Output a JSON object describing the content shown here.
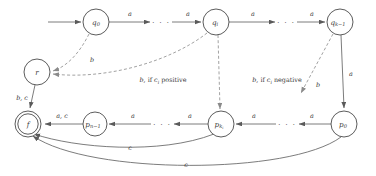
{
  "diagram": {
    "type": "state-machine",
    "colors": {
      "background": "#ffffff",
      "node_stroke": "#4a4a4a",
      "edge_solid": "#5a5a5a",
      "edge_dashed": "#8a8a8a",
      "text": "#3a3a3a"
    },
    "nodes": [
      {
        "id": "q0",
        "label_base": "q",
        "label_sub": "0",
        "x": 96,
        "y": 22,
        "r": 13,
        "accepting": false,
        "initial": true
      },
      {
        "id": "qi",
        "label_base": "q",
        "label_sub": "i",
        "x": 216,
        "y": 22,
        "r": 13,
        "accepting": false,
        "initial": false
      },
      {
        "id": "qk1",
        "label_base": "q",
        "label_sub": "k−1",
        "x": 340,
        "y": 22,
        "r": 13,
        "accepting": false,
        "initial": false
      },
      {
        "id": "r",
        "label_base": "r",
        "label_sub": "",
        "x": 37,
        "y": 72,
        "r": 13,
        "accepting": false,
        "initial": false
      },
      {
        "id": "f",
        "label_base": "f",
        "label_sub": "",
        "x": 28,
        "y": 124,
        "r": 13,
        "accepting": true,
        "initial": false
      },
      {
        "id": "pn1",
        "label_base": "p",
        "label_sub": "n−1",
        "x": 95,
        "y": 124,
        "r": 12,
        "accepting": false,
        "initial": false
      },
      {
        "id": "pki",
        "label_base": "p",
        "label_sub": "k",
        "label_sub2": "i",
        "x": 221,
        "y": 124,
        "r": 13,
        "accepting": false,
        "initial": false
      },
      {
        "id": "p0",
        "label_base": "p",
        "label_sub": "0",
        "x": 344,
        "y": 124,
        "r": 13,
        "accepting": false,
        "initial": false
      }
    ],
    "edge_labels": {
      "a": "a",
      "b": "b",
      "c": "c",
      "b_c": "b, c",
      "a_c": "a, c"
    },
    "top_transitions": [
      {
        "from": "q0",
        "to": "dots1",
        "label": "a",
        "x": 136,
        "y": 14
      },
      {
        "from": "dots1",
        "to": "qi",
        "label": "a",
        "x": 186,
        "y": 14
      },
      {
        "from": "qi",
        "to": "dots2",
        "label": "a",
        "x": 258,
        "y": 14
      },
      {
        "from": "dots2",
        "to": "qk1",
        "label": "a",
        "x": 310,
        "y": 14
      }
    ],
    "bottom_transitions": [
      {
        "from": "pn1",
        "to": "f",
        "label": "a, c",
        "x": 62,
        "y": 116
      },
      {
        "from": "dots3",
        "to": "pn1",
        "label": "a",
        "x": 140,
        "y": 116
      },
      {
        "from": "pki",
        "to": "dots3",
        "label": "a",
        "x": 190,
        "y": 116
      },
      {
        "from": "dots4",
        "to": "pki",
        "label": "a",
        "x": 258,
        "y": 116
      },
      {
        "from": "p0",
        "to": "dots4",
        "label": "a",
        "x": 312,
        "y": 116
      }
    ],
    "vertical_transitions": [
      {
        "from": "r",
        "to": "f",
        "label": "b, c",
        "x": 24,
        "y": 98
      },
      {
        "from": "qk1",
        "to": "p0",
        "label": "a",
        "x": 348,
        "y": 74
      }
    ],
    "dashed_transitions": [
      {
        "from": "q0",
        "to": "r",
        "label": "b",
        "x": 92,
        "y": 58,
        "style": "dashed"
      },
      {
        "from": "qi",
        "to": "r",
        "label": "b, if c_i positive",
        "x": 163,
        "y": 80,
        "style": "dashed"
      },
      {
        "from": "qi",
        "to": "pki",
        "label": "b, if c_i negative",
        "x": 276,
        "y": 80,
        "style": "dashed"
      },
      {
        "from": "qk1",
        "to": "mid",
        "label": "b",
        "x": 317,
        "y": 84,
        "style": "dashed"
      }
    ],
    "curved_transitions": [
      {
        "from": "pki",
        "to": "f",
        "label": "c",
        "x": 130,
        "y": 148
      },
      {
        "from": "p0",
        "to": "f",
        "label": "c",
        "x": 186,
        "y": 164
      }
    ],
    "condition_labels": {
      "positive": {
        "prefix": "b",
        "comma": ", if ",
        "var": "c",
        "sub": "i",
        "suffix": " positive"
      },
      "negative": {
        "prefix": "b",
        "comma": ", if ",
        "var": "c",
        "sub": "i",
        "suffix": " negative"
      }
    },
    "ellipsis": "· · ·",
    "ellipsis_positions": [
      {
        "id": "dots1",
        "x": 161,
        "y": 22
      },
      {
        "id": "dots2",
        "x": 286,
        "y": 22
      },
      {
        "id": "dots3",
        "x": 162,
        "y": 124
      },
      {
        "id": "dots4",
        "x": 287,
        "y": 124
      }
    ]
  }
}
